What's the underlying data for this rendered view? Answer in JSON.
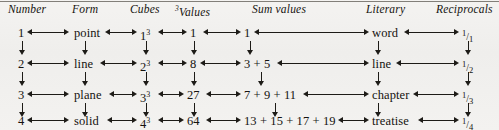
{
  "figure": {
    "title": "",
    "rule_color": "#6d6a64",
    "ink_color": "#1d1b17",
    "background_color": "#f2f1ef"
  },
  "headers": [
    {
      "label": "Number",
      "sup": ""
    },
    {
      "label": "Form",
      "sup": ""
    },
    {
      "label": "Cubes",
      "sup": ""
    },
    {
      "label": "Values",
      "sup": "3"
    },
    {
      "label": "Sum values",
      "sup": ""
    },
    {
      "label": "Literary",
      "sup": ""
    },
    {
      "label": "Reciprocals",
      "sup": ""
    }
  ],
  "rows": [
    {
      "number": "1",
      "form": "point",
      "cube_base": "1",
      "cube_exp": "3",
      "value": "1",
      "sum_values": "1",
      "literary": "word",
      "reciprocal_num": "1",
      "reciprocal_den": "1"
    },
    {
      "number": "2",
      "form": "line",
      "cube_base": "2",
      "cube_exp": "3",
      "value": "8",
      "sum_values": "3 + 5",
      "literary": "line",
      "reciprocal_num": "1",
      "reciprocal_den": "2"
    },
    {
      "number": "3",
      "form": "plane",
      "cube_base": "3",
      "cube_exp": "3",
      "value": "27",
      "sum_values": "7 + 9 + 11",
      "literary": "chapter",
      "reciprocal_num": "1",
      "reciprocal_den": "3"
    },
    {
      "number": "4",
      "form": "solid",
      "cube_base": "4",
      "cube_exp": "3",
      "value": "64",
      "sum_values": "13 + 15 + 17 + 19",
      "literary": "treatise",
      "reciprocal_num": "1",
      "reciprocal_den": "4"
    }
  ],
  "fraction_slash": "/"
}
